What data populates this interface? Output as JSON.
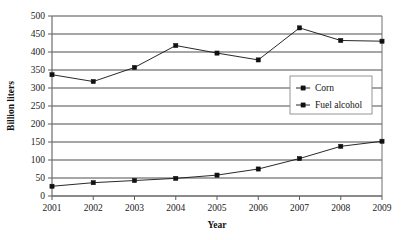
{
  "chart_data": {
    "type": "line",
    "title": "",
    "xlabel": "Year",
    "ylabel": "Billion liters",
    "categories": [
      2001,
      2002,
      2003,
      2004,
      2005,
      2006,
      2007,
      2008,
      2009
    ],
    "x": [
      2001,
      2002,
      2003,
      2004,
      2005,
      2006,
      2007,
      2008,
      2009
    ],
    "xlim": [
      2001,
      2009
    ],
    "ylim": [
      0,
      500
    ],
    "yticks": [
      0,
      50,
      100,
      150,
      200,
      250,
      300,
      350,
      400,
      450,
      500
    ],
    "ytick_labels": [
      "0",
      "50",
      "100",
      "150",
      "200",
      "250",
      "300",
      "350",
      "400",
      "450",
      "500"
    ],
    "xtick_labels": [
      "2001",
      "2002",
      "2003",
      "2004",
      "2005",
      "2006",
      "2007",
      "2008",
      "2009"
    ],
    "grid": "horizontal",
    "legend_position": "center-right",
    "marker": "filled-square",
    "series": [
      {
        "name": "Corn",
        "values": [
          337,
          318,
          357,
          418,
          397,
          378,
          467,
          432,
          430
        ]
      },
      {
        "name": "Fuel alcohol",
        "values": [
          27,
          37,
          43,
          49,
          58,
          75,
          104,
          138,
          152
        ]
      }
    ]
  },
  "legend": {
    "entries": [
      {
        "label": "Corn"
      },
      {
        "label": "Fuel alcohol"
      }
    ]
  },
  "axes": {
    "y_title": "Billion liters",
    "x_title": "Year"
  }
}
